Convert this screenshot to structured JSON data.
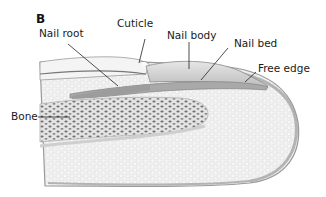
{
  "figure": {
    "panel_letter": "B",
    "labels": {
      "nail_root": "Nail root",
      "cuticle": "Cuticle",
      "nail_body": "Nail body",
      "nail_bed": "Nail bed",
      "free_edge": "Free edge",
      "bone": "Bone"
    },
    "colors": {
      "background": "#ffffff",
      "tissue": "#e9e9e9",
      "nail_plate": "#c9c9c9",
      "bone_dots": "#6e6e6e",
      "outline": "#8a8a8a",
      "leader_line": "#222222"
    }
  }
}
